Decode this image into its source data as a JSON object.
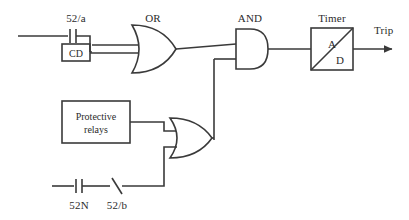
{
  "diagram": {
    "stroke_color": "#3a3a3a",
    "text_color": "#2b2b2b",
    "background": "#ffffff"
  },
  "labels": {
    "contact_52a": "52/a",
    "or_gate_top": "OR",
    "and_gate": "AND",
    "timer": "Timer",
    "trip": "Trip",
    "contact_52n": "52N",
    "contact_52b": "52/b"
  },
  "blocks": {
    "cd": {
      "label": "CD"
    },
    "protective_relays": {
      "line1": "Protective",
      "line2": "relays"
    },
    "timer_block": {
      "upper_label": "A",
      "lower_label": "D"
    }
  },
  "icons": {
    "contact_no": "normally-open-contact-icon",
    "contact_nc": "normally-closed-contact-icon",
    "or_gate": "or-gate-icon",
    "and_gate": "and-gate-icon",
    "timer": "timer-block-icon",
    "arrow": "arrow-right-icon"
  }
}
